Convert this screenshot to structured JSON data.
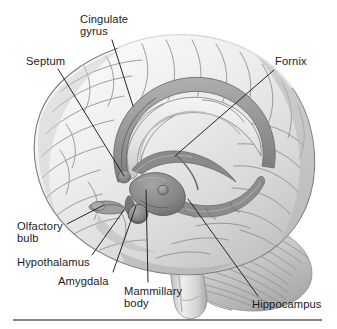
{
  "figure": {
    "kind": "anatomical-illustration",
    "style": "grayscale pencil / airbrush medical illustration",
    "background_color": "#ffffff",
    "ink_color": "#1b1b1b",
    "rule": {
      "visible": true,
      "color": "#5a5a5a",
      "x_start": 13,
      "x_end": 322,
      "y": 320,
      "thickness": 1.6
    },
    "palette": {
      "cortex_light": "#f2f2f2",
      "cortex_mid": "#d6d6d6",
      "cortex_shadow": "#a8a8a8",
      "sulcus_line": "#8d8d8d",
      "limbic_band": "#9a9a9a",
      "limbic_band_dark": "#7d7d7d",
      "deep_structure": "#6f6f6f",
      "cerebellum": "#c2c2c2",
      "brainstem": "#cfcfcf",
      "leader_line": "#1b1b1b"
    }
  },
  "labels": [
    {
      "id": "cingulate-gyrus",
      "text_lines": [
        "Cingulate",
        "gyrus"
      ],
      "text": "Cingulate gyrus",
      "x": 80,
      "y": 13,
      "align": "left",
      "leader": {
        "x1": 112,
        "y1": 40,
        "x2": 133,
        "y2": 106
      }
    },
    {
      "id": "septum",
      "text_lines": [
        "Septum"
      ],
      "text": "Septum",
      "x": 26,
      "y": 55,
      "align": "left",
      "leader": {
        "x1": 58,
        "y1": 69,
        "x2": 124,
        "y2": 176
      }
    },
    {
      "id": "fornix",
      "text_lines": [
        "Fornix"
      ],
      "text": "Fornix",
      "x": 275,
      "y": 55,
      "align": "left",
      "leader": {
        "x1": 274,
        "y1": 70,
        "x2": 175,
        "y2": 156
      }
    },
    {
      "id": "olfactory-bulb",
      "text_lines": [
        "Olfactory",
        "bulb"
      ],
      "text": "Olfactory bulb",
      "x": 17,
      "y": 220,
      "align": "left",
      "leader": {
        "x1": 67,
        "y1": 224,
        "x2": 104,
        "y2": 205
      }
    },
    {
      "id": "hypothalamus",
      "text_lines": [
        "Hypothalamus"
      ],
      "text": "Hypothalamus",
      "x": 17,
      "y": 256,
      "align": "left",
      "leader": {
        "x1": 92,
        "y1": 255,
        "x2": 124,
        "y2": 210
      }
    },
    {
      "id": "amygdala",
      "text_lines": [
        "Amygdala"
      ],
      "text": "Amygdala",
      "x": 58,
      "y": 275,
      "align": "left",
      "leader": {
        "x1": 113,
        "y1": 272,
        "x2": 136,
        "y2": 206
      }
    },
    {
      "id": "mammillary-body",
      "text_lines": [
        "Mammillary",
        "body"
      ],
      "text": "Mammillary body",
      "x": 124,
      "y": 285,
      "align": "left",
      "leader": {
        "x1": 148,
        "y1": 282,
        "x2": 146,
        "y2": 190
      }
    },
    {
      "id": "hippocampus",
      "text_lines": [
        "Hippocampus"
      ],
      "text": "Hippocampus",
      "x": 252,
      "y": 298,
      "align": "left",
      "leader": {
        "x1": 258,
        "y1": 296,
        "x2": 188,
        "y2": 199
      }
    }
  ]
}
